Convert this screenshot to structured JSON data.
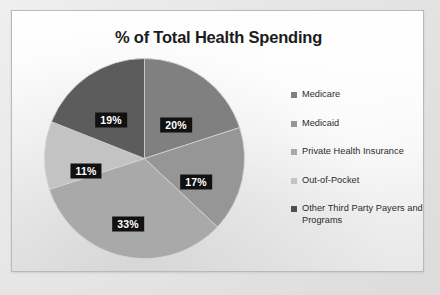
{
  "chart_data": {
    "type": "pie",
    "title": "% of Total Health Spending",
    "xlabel": "",
    "ylabel": "",
    "legend_position": "right",
    "grid": false,
    "start_angle_deg": 0,
    "direction": "clockwise",
    "categories": [
      "Medicare",
      "Medicaid",
      "Private Health Insurance",
      "Out-of-Pocket",
      "Other Third Party Payers and Programs"
    ],
    "values": [
      20,
      17,
      33,
      11,
      19
    ],
    "data_labels": [
      "20%",
      "17%",
      "33%",
      "11%",
      "19%"
    ],
    "colors": [
      "#808080",
      "#969696",
      "#a9a9a9",
      "#c3c3c3",
      "#5c5c5c"
    ],
    "label_text_color": "#ffffff",
    "label_box_color": "#111111"
  },
  "slide": {
    "title": "% of Total Health Spending",
    "background": "#fbfbfb",
    "border_color": "#b9b9b9"
  },
  "pie": {
    "slices": [
      {
        "name": "Medicare",
        "value": 20,
        "label": "20%",
        "color": "#808080",
        "label_x": 132,
        "label_y": 67
      },
      {
        "name": "Medicaid",
        "value": 17,
        "label": "17%",
        "color": "#969696",
        "label_x": 152,
        "label_y": 124
      },
      {
        "name": "Private Health Insurance",
        "value": 33,
        "label": "33%",
        "color": "#a9a9a9",
        "label_x": 84,
        "label_y": 166
      },
      {
        "name": "Out-of-Pocket",
        "value": 11,
        "label": "11%",
        "color": "#c3c3c3",
        "label_x": 42,
        "label_y": 113
      },
      {
        "name": "Other Third Party Payers and Programs",
        "value": 19,
        "label": "19%",
        "color": "#5c5c5c",
        "label_x": 67,
        "label_y": 62
      }
    ]
  },
  "legend": {
    "items": [
      {
        "label": "Medicare",
        "color": "#808080"
      },
      {
        "label": "Medicaid",
        "color": "#969696"
      },
      {
        "label": "Private Health Insurance",
        "color": "#a9a9a9"
      },
      {
        "label": "Out-of-Pocket",
        "color": "#c3c3c3"
      },
      {
        "label": "Other Third Party Payers and Programs",
        "color": "#4f4f4f"
      }
    ]
  }
}
